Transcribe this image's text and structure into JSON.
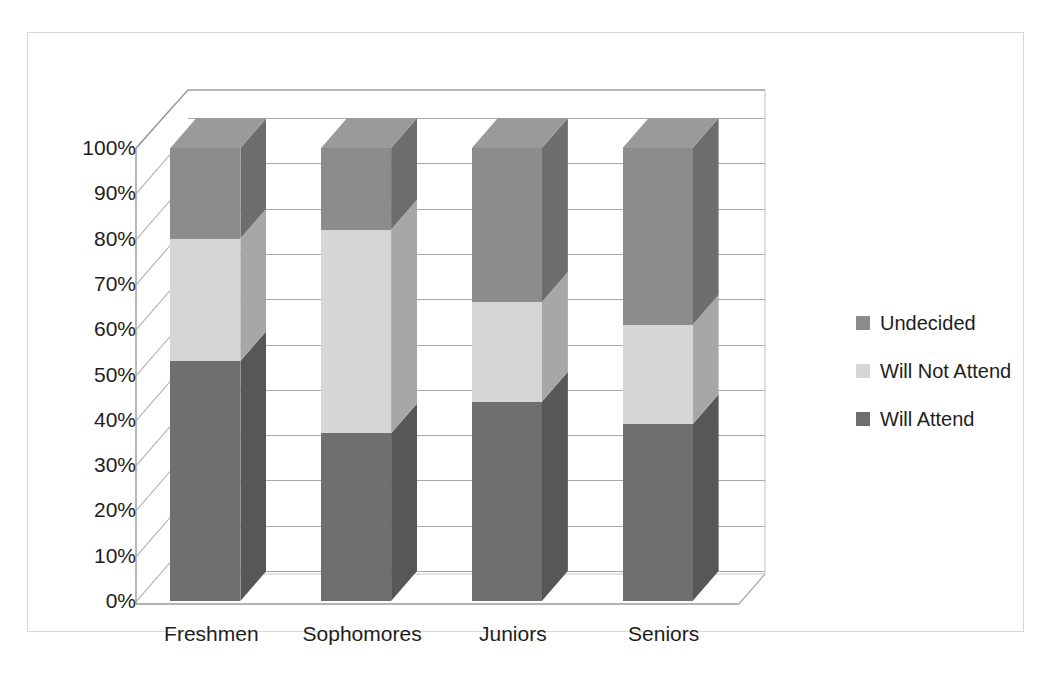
{
  "chart_data": {
    "type": "bar",
    "subtype": "stacked-column-3d-100pct",
    "title": "",
    "xlabel": "",
    "ylabel": "",
    "categories": [
      "Freshmen",
      "Sophomores",
      "Juniors",
      "Seniors"
    ],
    "series": [
      {
        "name": "Will Attend",
        "color": "#6f6f6f",
        "values": [
          53,
          37,
          44,
          39
        ]
      },
      {
        "name": "Will Not Attend",
        "color": "#d6d6d6",
        "values": [
          27,
          45,
          22,
          22
        ]
      },
      {
        "name": "Undecided",
        "color": "#8c8c8c",
        "values": [
          20,
          18,
          34,
          39
        ]
      }
    ],
    "stack_order_bottom_to_top": [
      "Will Attend",
      "Will Not Attend",
      "Undecided"
    ],
    "ylim": [
      0,
      100
    ],
    "ytick_labels": [
      "0%",
      "10%",
      "20%",
      "30%",
      "40%",
      "50%",
      "60%",
      "70%",
      "80%",
      "90%",
      "100%"
    ],
    "ytick_values": [
      0,
      10,
      20,
      30,
      40,
      50,
      60,
      70,
      80,
      90,
      100
    ],
    "grid": true,
    "legend_position": "right",
    "legend_entries": [
      "Undecided",
      "Will Not Attend",
      "Will Attend"
    ]
  },
  "legend": {
    "items": [
      {
        "label": "Undecided",
        "color": "#8c8c8c"
      },
      {
        "label": "Will Not Attend",
        "color": "#d6d6d6"
      },
      {
        "label": "Will Attend",
        "color": "#6f6f6f"
      }
    ]
  },
  "colors": {
    "plot_background": "#ffffff",
    "frame_border": "#d8d8d8",
    "gridline": "#9a9a9a",
    "axis_line": "#9a9a9a",
    "text": "#1e1e1e",
    "will_attend": "#6f6f6f",
    "will_not_attend": "#d6d6d6",
    "undecided": "#8c8c8c",
    "side_shade_factor": "0.78",
    "top_shade_factor": "1.12"
  }
}
